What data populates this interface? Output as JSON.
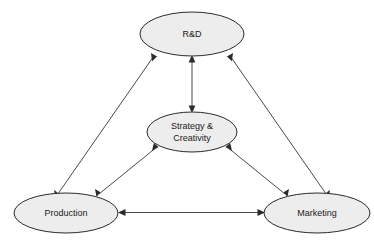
{
  "diagram": {
    "background_color": "#ffffff",
    "node_fill_color": "#ededed",
    "node_stroke_color": "#2b2b2b",
    "edge_color": "#4a4a4a",
    "nodes": [
      {
        "id": "rnd",
        "label": "R&D",
        "label_lines": [
          "R&D"
        ],
        "cx": 192,
        "cy": 34,
        "rx": 52,
        "ry": 22
      },
      {
        "id": "strategy",
        "label": "Strategy & Creativity",
        "label_lines": [
          "Strategy &",
          "Creativity"
        ],
        "cx": 192,
        "cy": 132,
        "rx": 45,
        "ry": 20
      },
      {
        "id": "production",
        "label": "Production",
        "label_lines": [
          "Production"
        ],
        "cx": 66,
        "cy": 213,
        "rx": 52,
        "ry": 20
      },
      {
        "id": "marketing",
        "label": "Marketing",
        "label_lines": [
          "Marketing"
        ],
        "cx": 317,
        "cy": 213,
        "rx": 53,
        "ry": 20
      }
    ],
    "edges": [
      {
        "id": "rnd-strategy",
        "from": "rnd",
        "to": "strategy",
        "direction": "bidirectional",
        "label": "R&D ↔ Strategy & Creativity"
      },
      {
        "id": "rnd-production",
        "from": "rnd",
        "to": "production",
        "direction": "bidirectional",
        "label": "R&D ↔ Production"
      },
      {
        "id": "rnd-marketing",
        "from": "rnd",
        "to": "marketing",
        "direction": "bidirectional",
        "label": "R&D ↔ Marketing"
      },
      {
        "id": "production-strategy",
        "from": "production",
        "to": "strategy",
        "direction": "bidirectional",
        "label": "Production ↔ Strategy & Creativity"
      },
      {
        "id": "marketing-strategy",
        "from": "marketing",
        "to": "strategy",
        "direction": "bidirectional",
        "label": "Marketing ↔ Strategy & Creativity"
      },
      {
        "id": "production-marketing",
        "from": "production",
        "to": "marketing",
        "direction": "bidirectional",
        "label": "Production ↔ Marketing"
      }
    ]
  }
}
